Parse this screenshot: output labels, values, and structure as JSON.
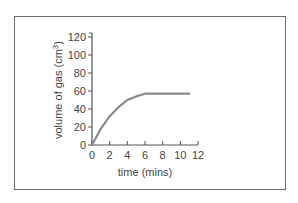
{
  "chart_data": {
    "type": "line",
    "title": "",
    "xlabel": "time (mins)",
    "ylabel": "volume of gas (cm³)",
    "ylabel_main": "volume of gas (cm",
    "ylabel_sup": "3",
    "ylabel_end": ")",
    "xlim": [
      0,
      12
    ],
    "ylim": [
      0,
      120
    ],
    "x_ticks": [
      0,
      2,
      4,
      6,
      8,
      10,
      12
    ],
    "y_ticks": [
      0,
      20,
      40,
      60,
      80,
      100,
      120
    ],
    "grid": false,
    "legend": null,
    "series": [
      {
        "name": "volume of gas",
        "x": [
          0,
          1,
          2,
          3,
          4,
          5,
          6,
          11
        ],
        "y": [
          0,
          18,
          32,
          42,
          50,
          54,
          57,
          57
        ]
      }
    ],
    "line_color": "#8a8a8a",
    "axis_color": "#555555"
  }
}
